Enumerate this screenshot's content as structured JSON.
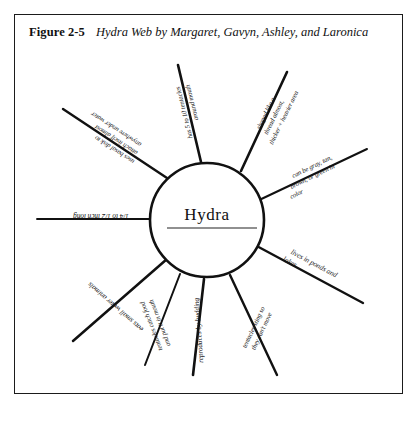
{
  "figure": {
    "number_label": "Figure 2-5",
    "title": "Hydra Web by Margaret, Gavyn, Ashley, and Laronica"
  },
  "web": {
    "center_label": "Hydra",
    "spoke_count": 9,
    "spokes": [
      {
        "id": "spoke-size",
        "angle_deg": 180,
        "orientation": "upside-down",
        "lines": [
          "1/4 to 1/2 inch long"
        ]
      },
      {
        "id": "spoke-food",
        "angle_deg": 208,
        "orientation": "upside-down",
        "lines": [
          "eats small water animals"
        ]
      },
      {
        "id": "spoke-catch-prey",
        "angle_deg": 235,
        "orientation": "upside-down",
        "lines": [
          "tentacles catch food",
          "and put it in mouth"
        ]
      },
      {
        "id": "spoke-budding",
        "angle_deg": 262,
        "orientation": "upside-down",
        "lines": [
          "reproduces by budding"
        ]
      },
      {
        "id": "spoke-sting",
        "angle_deg": 292,
        "orientation": "upside-down",
        "lines": [
          "tentacles sting so",
          "they can't move"
        ]
      },
      {
        "id": "spoke-habitat",
        "angle_deg": 333,
        "orientation": "upright",
        "lines": [
          "lives in ponds and",
          "lakes"
        ]
      },
      {
        "id": "spoke-color",
        "angle_deg": 20,
        "orientation": "upright",
        "lines": [
          "can be gray, tan,",
          "brown, or green in",
          "color"
        ]
      },
      {
        "id": "spoke-shape",
        "angle_deg": 60,
        "orientation": "upright",
        "lines": [
          "shaped like a",
          "thread almost,",
          "thicker + heavier area"
        ]
      },
      {
        "id": "spoke-tentacle-count",
        "angle_deg": 104,
        "orientation": "upside-down",
        "lines": [
          "has 5 to 10 tentacles",
          "around mouth"
        ]
      },
      {
        "id": "spoke-attach",
        "angle_deg": 143,
        "orientation": "upside-down",
        "lines": [
          "uses basal disk to",
          "attach itself almost",
          "anywhere under water"
        ]
      }
    ]
  },
  "colors": {
    "ink": "#111111",
    "paper": "#ffffff",
    "frame": "#1b1b1b"
  }
}
